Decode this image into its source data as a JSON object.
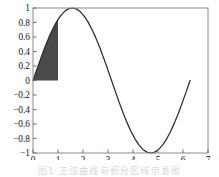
{
  "figure": {
    "background_color": "#ffffff",
    "frame_color": "#8a8a8a",
    "caption_text": "图1 正弦曲线与积分区域示意图"
  },
  "chart_data": {
    "type": "line",
    "title": "",
    "xlabel": "",
    "ylabel": "",
    "xlim": [
      0,
      7
    ],
    "ylim": [
      -1,
      1
    ],
    "grid": false,
    "legend": "none",
    "curve_color": "#2b2b2b",
    "fill_color": "#4a4a4a",
    "x_ticks": [
      0,
      1,
      2,
      3,
      4,
      5,
      6,
      7
    ],
    "x_tick_labels": [
      "0",
      "1",
      "2",
      "3",
      "4",
      "5",
      "6",
      "7"
    ],
    "y_ticks": [
      -1,
      -0.8,
      -0.6,
      -0.4,
      -0.2,
      0,
      0.2,
      0.4,
      0.6,
      0.8,
      1
    ],
    "y_tick_labels": [
      "−1",
      "−0.8",
      "−0.6",
      "−0.4",
      "−0.2",
      "0",
      "0.2",
      "0.4",
      "0.6",
      "0.8",
      "1"
    ],
    "series": [
      {
        "name": "sin(x)",
        "x": [
          0,
          0.1571,
          0.3142,
          0.4712,
          0.6283,
          0.7854,
          0.9425,
          1.0996,
          1.2566,
          1.4137,
          1.5708,
          1.7279,
          1.885,
          2.042,
          2.1991,
          2.3562,
          2.5133,
          2.6704,
          2.8274,
          2.9845,
          3.1416,
          3.2987,
          3.4558,
          3.6128,
          3.7699,
          3.927,
          4.0841,
          4.2412,
          4.3982,
          4.5553,
          4.7124,
          4.8695,
          5.0265,
          5.1836,
          5.3407,
          5.4978,
          5.6549,
          5.8119,
          5.969,
          6.1261,
          6.2832
        ],
        "y": [
          0,
          0.1564,
          0.309,
          0.454,
          0.5878,
          0.7071,
          0.809,
          0.891,
          0.9511,
          0.9877,
          1,
          0.9877,
          0.9511,
          0.891,
          0.809,
          0.7071,
          0.5878,
          0.454,
          0.309,
          0.1564,
          0,
          -0.1564,
          -0.309,
          -0.454,
          -0.5878,
          -0.7071,
          -0.809,
          -0.891,
          -0.9511,
          -0.9877,
          -1,
          -0.9877,
          -0.9511,
          -0.891,
          -0.809,
          -0.7071,
          -0.5878,
          -0.454,
          -0.309,
          -0.1564,
          0
        ]
      }
    ],
    "shaded_region": {
      "name": "area-under-sine-0-to-1",
      "x_start": 0,
      "x_end": 1,
      "y_base": 0,
      "y_at_x_end": 0.8415,
      "fill_color": "#4a4a4a"
    },
    "curve_endpoints": {
      "x_min": 0,
      "x_max": 6.2832,
      "peak_x": 1.5708,
      "peak_y": 1,
      "trough_x": 4.7124,
      "trough_y": -1
    }
  }
}
